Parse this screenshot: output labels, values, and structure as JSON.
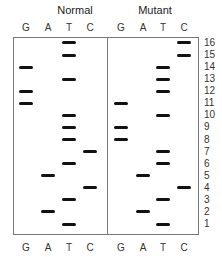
{
  "panels": [
    {
      "title": "Normal",
      "lanes": [
        "G",
        "A",
        "T",
        "C"
      ],
      "bands": [
        {
          "row": 1,
          "lane": "T"
        },
        {
          "row": 2,
          "lane": "A"
        },
        {
          "row": 3,
          "lane": "T"
        },
        {
          "row": 4,
          "lane": "C"
        },
        {
          "row": 5,
          "lane": "A"
        },
        {
          "row": 6,
          "lane": "T"
        },
        {
          "row": 7,
          "lane": "C"
        },
        {
          "row": 8,
          "lane": "T"
        },
        {
          "row": 9,
          "lane": "T"
        },
        {
          "row": 10,
          "lane": "T"
        },
        {
          "row": 11,
          "lane": "G"
        },
        {
          "row": 12,
          "lane": "G"
        },
        {
          "row": 13,
          "lane": "T"
        },
        {
          "row": 14,
          "lane": "G"
        },
        {
          "row": 15,
          "lane": "T"
        },
        {
          "row": 16,
          "lane": "T"
        }
      ]
    },
    {
      "title": "Mutant",
      "lanes": [
        "G",
        "A",
        "T",
        "C"
      ],
      "bands": [
        {
          "row": 1,
          "lane": "T"
        },
        {
          "row": 2,
          "lane": "A"
        },
        {
          "row": 3,
          "lane": "T"
        },
        {
          "row": 4,
          "lane": "C"
        },
        {
          "row": 5,
          "lane": "A"
        },
        {
          "row": 6,
          "lane": "T"
        },
        {
          "row": 7,
          "lane": "T"
        },
        {
          "row": 8,
          "lane": "G"
        },
        {
          "row": 9,
          "lane": "G"
        },
        {
          "row": 10,
          "lane": "T"
        },
        {
          "row": 11,
          "lane": "G"
        },
        {
          "row": 12,
          "lane": "T"
        },
        {
          "row": 13,
          "lane": "T"
        },
        {
          "row": 14,
          "lane": "T"
        },
        {
          "row": 15,
          "lane": "C"
        },
        {
          "row": 16,
          "lane": "C"
        }
      ]
    }
  ],
  "row_numbers": [
    "16",
    "15",
    "14",
    "13",
    "12",
    "11",
    "10",
    "9",
    "8",
    "7",
    "6",
    "5",
    "4",
    "3",
    "2",
    "1"
  ],
  "colors": {
    "band": "#111111",
    "border": "#777777",
    "text": "#333333"
  }
}
